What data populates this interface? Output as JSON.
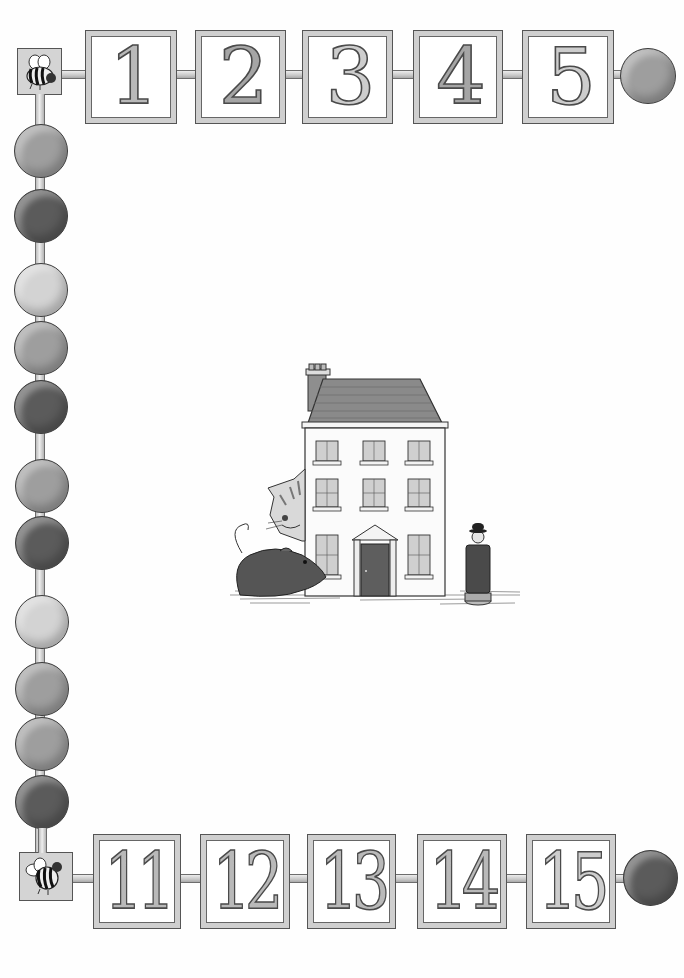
{
  "illustration": {
    "title": "Counting book page",
    "top_row": {
      "tiles": [
        {
          "label": "1",
          "shade": "mid"
        },
        {
          "label": "2",
          "shade": "dark"
        },
        {
          "label": "3",
          "shade": "light"
        },
        {
          "label": "4",
          "shade": "dark"
        },
        {
          "label": "5",
          "shade": "light"
        }
      ],
      "corner_icon": "bee-icon",
      "end_bead": "mid"
    },
    "bottom_row": {
      "tiles": [
        {
          "label": "11",
          "shade": "mid"
        },
        {
          "label": "12",
          "shade": "mid"
        },
        {
          "label": "13",
          "shade": "mid"
        },
        {
          "label": "14",
          "shade": "mid"
        },
        {
          "label": "15",
          "shade": "light"
        }
      ],
      "corner_icon": "bee-icon",
      "end_bead": "dark"
    },
    "left_column_beads": [
      "mid",
      "dark",
      "light",
      "mid",
      "dark",
      "mid",
      "dark",
      "light",
      "mid",
      "mid",
      "dark"
    ],
    "scene": {
      "objects": [
        "house",
        "cat",
        "rat",
        "man-figurine"
      ],
      "house": {
        "floors": 3,
        "windows_per_floor": 3,
        "has_door": true,
        "has_chimney": true
      }
    },
    "colors": {
      "background": "#ffffff",
      "tile_frame": "#cfcfcf",
      "outline": "#4a4a4a",
      "bead_dark": "#5b5b5b",
      "bead_mid": "#9e9e9e",
      "bead_light": "#d3d3d3"
    }
  }
}
